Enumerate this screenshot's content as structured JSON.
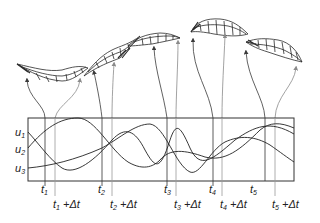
{
  "figure": {
    "colors": {
      "ink": "#2a2a2a",
      "arrow_dark": "#3a3a3a",
      "arrow_light": "#8a8a8a",
      "box": "#333333"
    }
  },
  "signals": {
    "labels": [
      {
        "base": "u",
        "sub": "1"
      },
      {
        "base": "u",
        "sub": "2"
      },
      {
        "base": "u",
        "sub": "3"
      }
    ]
  },
  "time_markers": [
    {
      "id": "t1",
      "base": "t",
      "sub": "1",
      "suffix": "",
      "x": 45,
      "row": 0
    },
    {
      "id": "t1dt",
      "base": "t",
      "sub": "1",
      "suffix": " +Δt",
      "x": 55,
      "row": 1
    },
    {
      "id": "t2",
      "base": "t",
      "sub": "2",
      "suffix": "",
      "x": 102,
      "row": 0
    },
    {
      "id": "t2dt",
      "base": "t",
      "sub": "2",
      "suffix": " +Δt",
      "x": 112,
      "row": 1
    },
    {
      "id": "t3",
      "base": "t",
      "sub": "3",
      "suffix": "",
      "x": 167,
      "row": 0
    },
    {
      "id": "t3dt",
      "base": "t",
      "sub": "3",
      "suffix": " +Δt",
      "x": 176,
      "row": 1
    },
    {
      "id": "t4",
      "base": "t",
      "sub": "4",
      "suffix": "",
      "x": 213,
      "row": 0
    },
    {
      "id": "t4dt",
      "base": "t",
      "sub": "4",
      "suffix": " +Δt",
      "x": 222,
      "row": 1
    },
    {
      "id": "t5",
      "base": "t",
      "sub": "5",
      "suffix": "",
      "x": 265,
      "row": 0
    },
    {
      "id": "t5dt",
      "base": "t",
      "sub": "5",
      "suffix": " +Δt",
      "x": 275,
      "row": 1
    }
  ],
  "poses": [
    {
      "id": "pose-1",
      "label": "wireframe body pose 1"
    },
    {
      "id": "pose-2",
      "label": "wireframe body pose 2"
    },
    {
      "id": "pose-3",
      "label": "wireframe body pose 3"
    },
    {
      "id": "pose-4",
      "label": "wireframe body pose 4"
    },
    {
      "id": "pose-5",
      "label": "wireframe body pose 5"
    }
  ]
}
